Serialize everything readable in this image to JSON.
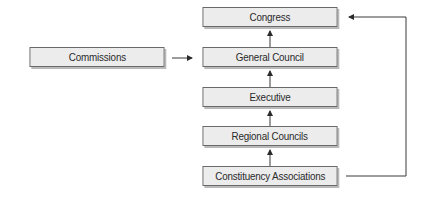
{
  "diagram": {
    "type": "organizational-flow",
    "nodes": [
      {
        "id": "congress",
        "label": "Congress"
      },
      {
        "id": "general_council",
        "label": "General Council"
      },
      {
        "id": "executive",
        "label": "Executive"
      },
      {
        "id": "regional_councils",
        "label": "Regional Councils"
      },
      {
        "id": "constituency_associations",
        "label": "Constituency Associations"
      },
      {
        "id": "commissions",
        "label": "Commissions"
      }
    ],
    "edges": [
      {
        "from": "constituency_associations",
        "to": "regional_councils"
      },
      {
        "from": "regional_councils",
        "to": "executive"
      },
      {
        "from": "executive",
        "to": "general_council"
      },
      {
        "from": "general_council",
        "to": "congress"
      },
      {
        "from": "commissions",
        "to": "general_council"
      },
      {
        "from": "constituency_associations",
        "to": "congress"
      }
    ]
  },
  "labels": {
    "congress": "Congress",
    "general_council": "General Council",
    "executive": "Executive",
    "regional_councils": "Regional Councils",
    "constituency_associations": "Constituency Associations",
    "commissions": "Commissions"
  },
  "colors": {
    "box_fill": "#ececec",
    "box_border": "#6a6a6a",
    "box_shadow": "#b9b9b9",
    "line": "#3a3a3a",
    "text": "#2a2a2a"
  }
}
